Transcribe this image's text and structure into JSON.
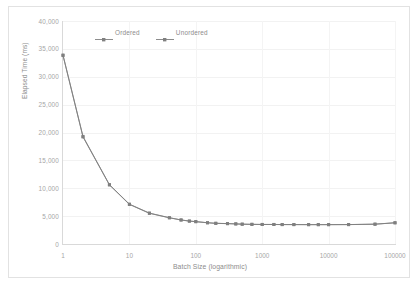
{
  "chart_data": {
    "type": "line",
    "title": "",
    "xlabel": "Batch Size (logarithmic)",
    "ylabel": "Elapsed Time (ms)",
    "xscale": "log",
    "xlim": [
      1,
      100000
    ],
    "ylim": [
      0,
      40000
    ],
    "grid": true,
    "legend_position": "top-center",
    "xticks": [
      "1",
      "10",
      "100",
      "1000",
      "10000",
      "100000"
    ],
    "xtick_values": [
      1,
      10,
      100,
      1000,
      10000,
      100000
    ],
    "yticks": [
      "0",
      "5,000",
      "10,000",
      "15,000",
      "20,000",
      "25,000",
      "30,000",
      "35,000",
      "40,000"
    ],
    "ytick_values": [
      0,
      5000,
      10000,
      15000,
      20000,
      25000,
      30000,
      35000,
      40000
    ],
    "series": [
      {
        "name": "Ordered",
        "color": "#808080",
        "x": [
          1,
          2,
          5,
          10,
          20,
          40,
          60,
          80,
          100,
          150,
          200,
          300,
          400,
          500,
          700,
          1000,
          1500,
          2000,
          3000,
          5000,
          7000,
          10000,
          20000,
          50000,
          100000
        ],
        "values": [
          33800,
          19200,
          10600,
          7100,
          5500,
          4700,
          4300,
          4100,
          4000,
          3800,
          3700,
          3650,
          3600,
          3550,
          3520,
          3500,
          3500,
          3480,
          3480,
          3470,
          3470,
          3470,
          3480,
          3550,
          3800
        ]
      },
      {
        "name": "Unordered",
        "color": "#7f7f7f",
        "x": [
          1,
          2,
          5,
          10,
          20,
          40,
          60,
          80,
          100,
          150,
          200,
          300,
          400,
          500,
          700,
          1000,
          1500,
          2000,
          3000,
          5000,
          7000,
          10000,
          20000,
          50000,
          100000
        ],
        "values": [
          33900,
          19300,
          10650,
          7150,
          5550,
          4720,
          4320,
          4120,
          4020,
          3820,
          3720,
          3660,
          3610,
          3560,
          3530,
          3510,
          3505,
          3490,
          3485,
          3475,
          3472,
          3472,
          3485,
          3560,
          3810
        ]
      }
    ]
  },
  "legend": {
    "items": [
      {
        "label": "Ordered"
      },
      {
        "label": "Unordered"
      }
    ]
  }
}
